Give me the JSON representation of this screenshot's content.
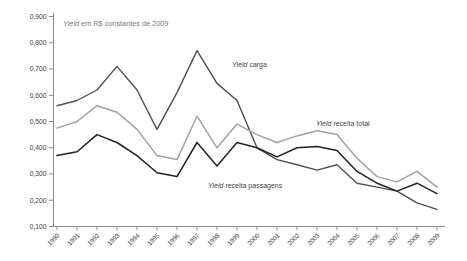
{
  "chart_data": {
    "type": "line",
    "title": "Yield em R$ constantes de 2009",
    "grid": false,
    "legend": "inline-annotations",
    "x_categories": [
      "1990",
      "1991",
      "1992",
      "1993",
      "1994",
      "1995",
      "1996",
      "1997",
      "1998",
      "1999",
      "2000",
      "2001",
      "2002",
      "2003",
      "2004",
      "2005",
      "2006",
      "2007",
      "2008",
      "2009"
    ],
    "y_axis": {
      "min": 0.1,
      "max": 0.9,
      "tick_step": 0.1,
      "tick_labels": [
        "0,100",
        "0,200",
        "0,300",
        "0,400",
        "0,500",
        "0,600",
        "0,700",
        "0,800",
        "0,900"
      ]
    },
    "series": [
      {
        "id": "carga",
        "name": "Yield carga",
        "color": "#4f4f4f",
        "values": [
          0.56,
          0.58,
          0.62,
          0.71,
          0.62,
          0.47,
          0.61,
          0.77,
          0.645,
          0.58,
          0.4,
          0.355,
          0.335,
          0.315,
          0.335,
          0.265,
          0.25,
          0.235,
          0.19,
          0.165
        ]
      },
      {
        "id": "total",
        "name": "Yield receita total",
        "color": "#a2a2a2",
        "values": [
          0.475,
          0.5,
          0.56,
          0.535,
          0.47,
          0.37,
          0.355,
          0.52,
          0.4,
          0.49,
          0.45,
          0.42,
          0.445,
          0.465,
          0.45,
          0.36,
          0.29,
          0.27,
          0.31,
          0.25
        ]
      },
      {
        "id": "passagens",
        "name": "Yield receita passagens",
        "color": "#222222",
        "values": [
          0.37,
          0.385,
          0.45,
          0.42,
          0.37,
          0.305,
          0.29,
          0.42,
          0.33,
          0.42,
          0.4,
          0.365,
          0.4,
          0.405,
          0.39,
          0.31,
          0.265,
          0.235,
          0.265,
          0.225
        ]
      }
    ],
    "annotations": [
      {
        "text": "Yield carga",
        "series": "carga"
      },
      {
        "text": "Yield receita total",
        "series": "total"
      },
      {
        "text": "Yield receita passagens",
        "series": "passagens"
      }
    ],
    "colors": {
      "axis": "#8a8a8a",
      "tick_text": "#3d3d3d",
      "title_text": "#7a7a7a",
      "annotation_text": "#3f3f3f"
    }
  }
}
